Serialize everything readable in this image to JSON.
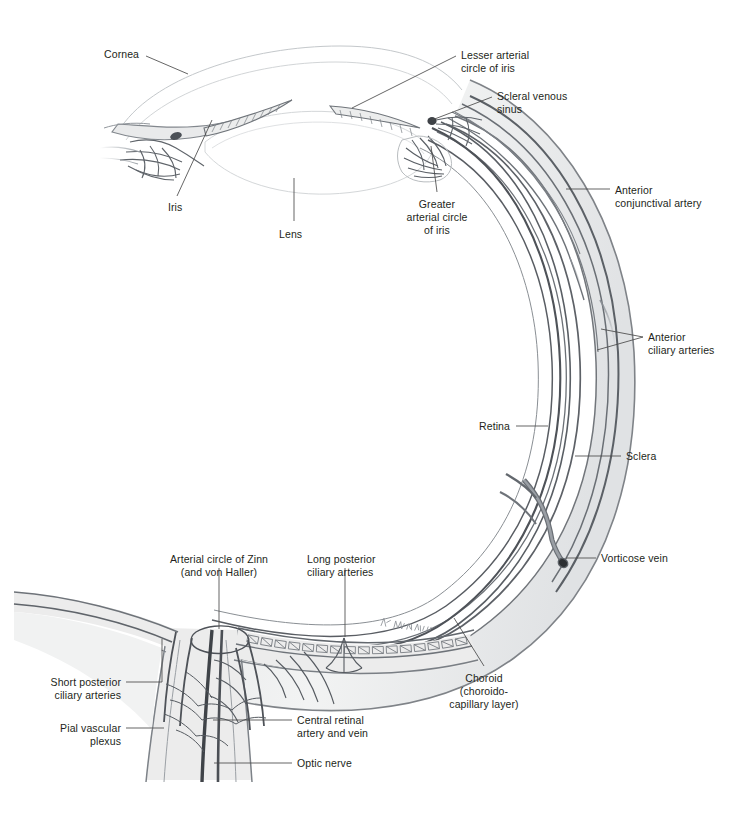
{
  "figure": {
    "signature": "K. Wesker",
    "ink": "#231f20",
    "vessel_dark": "#55595e",
    "vessel_mid": "#7d8288",
    "tissue_fill": "#eceded",
    "faint_line": "#cfd2d4"
  },
  "labels": [
    {
      "id": "cornea",
      "text": "Cornea",
      "x": 104,
      "y": 48,
      "align": "left"
    },
    {
      "id": "lesser-arterial-circle",
      "text": "Lesser arterial\ncircle of iris",
      "x": 461,
      "y": 49,
      "align": "left"
    },
    {
      "id": "scleral-venous-sinus",
      "text": "Scleral venous\nsinus",
      "x": 497,
      "y": 90,
      "align": "left"
    },
    {
      "id": "iris",
      "text": "Iris",
      "x": 168,
      "y": 201,
      "align": "left"
    },
    {
      "id": "lens",
      "text": "Lens",
      "x": 279,
      "y": 228,
      "align": "left"
    },
    {
      "id": "greater-arterial-circle",
      "text": "Greater\narterial circle\nof iris",
      "x": 437,
      "y": 198,
      "align": "center"
    },
    {
      "id": "anterior-conjunctival-artery",
      "text": "Anterior\nconjunctival artery",
      "x": 615,
      "y": 184,
      "align": "left"
    },
    {
      "id": "anterior-ciliary-arteries",
      "text": "Anterior\nciliary arteries",
      "x": 648,
      "y": 331,
      "align": "left"
    },
    {
      "id": "retina",
      "text": "Retina",
      "x": 479,
      "y": 420,
      "align": "left"
    },
    {
      "id": "sclera",
      "text": "Sclera",
      "x": 626,
      "y": 450,
      "align": "left"
    },
    {
      "id": "vorticose-vein",
      "text": "Vorticose vein",
      "x": 601,
      "y": 552,
      "align": "left"
    },
    {
      "id": "arterial-circle-of-zinn",
      "text": "Arterial circle of Zinn\n(and von Haller)",
      "x": 219,
      "y": 553,
      "align": "center"
    },
    {
      "id": "long-posterior-ciliary-arteries",
      "text": "Long posterior\nciliary arteries",
      "x": 307,
      "y": 553,
      "align": "left"
    },
    {
      "id": "choroid",
      "text": "Choroid\n(choroido-\ncapillary layer)",
      "x": 484,
      "y": 672,
      "align": "center"
    },
    {
      "id": "short-posterior-ciliary-arteries",
      "text": "Short posterior\nciliary arteries",
      "x": 121,
      "y": 676,
      "align": "right"
    },
    {
      "id": "pial-vascular-plexus",
      "text": "Pial vascular\nplexus",
      "x": 121,
      "y": 722,
      "align": "right"
    },
    {
      "id": "central-retinal-artery-vein",
      "text": "Central retinal\nartery and vein",
      "x": 297,
      "y": 714,
      "align": "left"
    },
    {
      "id": "optic-nerve",
      "text": "Optic nerve",
      "x": 297,
      "y": 757,
      "align": "left"
    }
  ],
  "leaders": [
    {
      "id": "leader-cornea",
      "d": "M146,56 L188,74"
    },
    {
      "id": "leader-lesser-arterial-circle",
      "d": "M456,56 L352,108"
    },
    {
      "id": "leader-scleral-venous-sinus",
      "d": "M492,97 L432,120"
    },
    {
      "id": "leader-iris",
      "d": "M177,196 L212,120"
    },
    {
      "id": "leader-lens",
      "d": "M294,221 L294,178"
    },
    {
      "id": "leader-greater-arterial-circle",
      "d": "M437,192 L431,146"
    },
    {
      "id": "leader-anterior-conjunctival",
      "d": "M610,189 L566,189"
    },
    {
      "id": "leader-anterior-ciliary-a",
      "d": "M643,337 L601,329"
    },
    {
      "id": "leader-anterior-ciliary-b",
      "d": "M643,337 L597,350"
    },
    {
      "id": "leader-retina",
      "d": "M516,426 L548,426"
    },
    {
      "id": "leader-sclera",
      "d": "M621,456 L575,456"
    },
    {
      "id": "leader-vorticose-vein",
      "d": "M596,558 L566,558"
    },
    {
      "id": "leader-zinn",
      "d": "M219,568 L219,629"
    },
    {
      "id": "leader-long-post-ciliary",
      "d": "M345,568 L345,637"
    },
    {
      "id": "leader-choroid",
      "d": "M484,666 L454,618"
    },
    {
      "id": "leader-short-post-ciliary",
      "d": "M126,682 L162,682 L162,639"
    },
    {
      "id": "leader-pial-plexus",
      "d": "M126,728 L164,728"
    },
    {
      "id": "leader-central-retinal",
      "d": "M292,720 L213,720"
    },
    {
      "id": "leader-optic-nerve",
      "d": "M292,763 L214,763"
    }
  ]
}
